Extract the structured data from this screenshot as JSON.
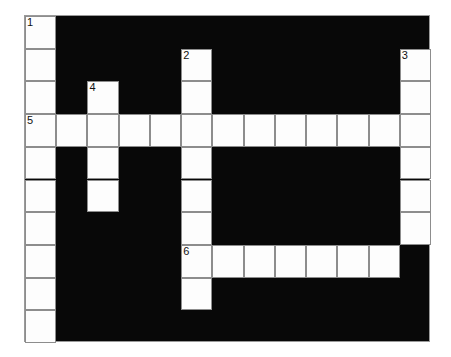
{
  "puzzle": {
    "title": "Crossword Grid",
    "type": "crossword",
    "grid": {
      "columns": 13,
      "rows": 10,
      "cell_width": 31.23,
      "cell_height": 32.7,
      "origin_x": 24,
      "origin_y": 15,
      "block_color": "#080808",
      "cell_color": "#fdfdfd",
      "line_color": "#8d8d8d",
      "border_color": "#9a9a9a",
      "number_color": "#111111"
    },
    "entries": [
      {
        "number": "1",
        "direction": "down",
        "start_row": 0,
        "start_col": 0,
        "length": 10
      },
      {
        "number": "2",
        "direction": "down",
        "start_row": 1,
        "start_col": 5,
        "length": 9
      },
      {
        "number": "3",
        "direction": "down",
        "start_row": 1,
        "start_col": 12,
        "length": 6
      },
      {
        "number": "4",
        "direction": "down",
        "start_row": 2,
        "start_col": 2,
        "length": 4
      },
      {
        "number": "5",
        "direction": "across",
        "start_row": 3,
        "start_col": 0,
        "length": 13
      },
      {
        "number": "6",
        "direction": "across",
        "start_row": 7,
        "start_col": 5,
        "length": 7
      }
    ],
    "white_cells": [
      {
        "row": 0,
        "col": 0,
        "number": "1"
      },
      {
        "row": 1,
        "col": 0,
        "number": ""
      },
      {
        "row": 2,
        "col": 0,
        "number": ""
      },
      {
        "row": 3,
        "col": 0,
        "number": "5"
      },
      {
        "row": 4,
        "col": 0,
        "number": ""
      },
      {
        "row": 5,
        "col": 0,
        "number": ""
      },
      {
        "row": 6,
        "col": 0,
        "number": ""
      },
      {
        "row": 7,
        "col": 0,
        "number": ""
      },
      {
        "row": 8,
        "col": 0,
        "number": ""
      },
      {
        "row": 9,
        "col": 0,
        "number": ""
      },
      {
        "row": 1,
        "col": 5,
        "number": "2"
      },
      {
        "row": 2,
        "col": 5,
        "number": ""
      },
      {
        "row": 3,
        "col": 5,
        "number": ""
      },
      {
        "row": 4,
        "col": 5,
        "number": ""
      },
      {
        "row": 5,
        "col": 5,
        "number": ""
      },
      {
        "row": 6,
        "col": 5,
        "number": ""
      },
      {
        "row": 7,
        "col": 5,
        "number": "6"
      },
      {
        "row": 8,
        "col": 5,
        "number": ""
      },
      {
        "row": 1,
        "col": 12,
        "number": "3"
      },
      {
        "row": 2,
        "col": 12,
        "number": ""
      },
      {
        "row": 3,
        "col": 12,
        "number": ""
      },
      {
        "row": 4,
        "col": 12,
        "number": ""
      },
      {
        "row": 5,
        "col": 12,
        "number": ""
      },
      {
        "row": 6,
        "col": 12,
        "number": ""
      },
      {
        "row": 2,
        "col": 2,
        "number": "4"
      },
      {
        "row": 3,
        "col": 2,
        "number": ""
      },
      {
        "row": 4,
        "col": 2,
        "number": ""
      },
      {
        "row": 5,
        "col": 2,
        "number": ""
      },
      {
        "row": 3,
        "col": 1,
        "number": ""
      },
      {
        "row": 3,
        "col": 3,
        "number": ""
      },
      {
        "row": 3,
        "col": 4,
        "number": ""
      },
      {
        "row": 3,
        "col": 6,
        "number": ""
      },
      {
        "row": 3,
        "col": 7,
        "number": ""
      },
      {
        "row": 3,
        "col": 8,
        "number": ""
      },
      {
        "row": 3,
        "col": 9,
        "number": ""
      },
      {
        "row": 3,
        "col": 10,
        "number": ""
      },
      {
        "row": 3,
        "col": 11,
        "number": ""
      },
      {
        "row": 7,
        "col": 6,
        "number": ""
      },
      {
        "row": 7,
        "col": 7,
        "number": ""
      },
      {
        "row": 7,
        "col": 8,
        "number": ""
      },
      {
        "row": 7,
        "col": 9,
        "number": ""
      },
      {
        "row": 7,
        "col": 10,
        "number": ""
      },
      {
        "row": 7,
        "col": 11,
        "number": ""
      }
    ]
  }
}
